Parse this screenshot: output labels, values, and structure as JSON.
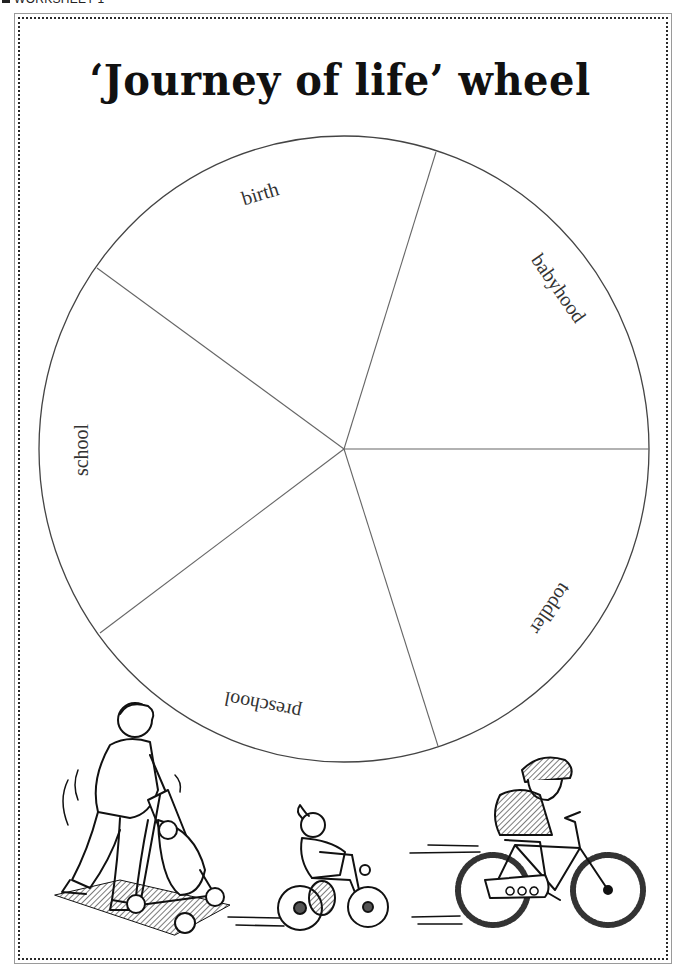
{
  "header": {
    "tag_label": "WORKSHEET 1"
  },
  "title": "‘Journey of life’ wheel",
  "wheel": {
    "center": [
      344,
      449
    ],
    "radius_x": 305,
    "radius_y": 313,
    "segments": [
      {
        "label": "birth"
      },
      {
        "label": "babyhood"
      },
      {
        "label": "toddler"
      },
      {
        "label": "preschool"
      },
      {
        "label": "school"
      }
    ]
  },
  "illustrations": [
    {
      "name": "parent-with-pram",
      "description": "Adult pushing baby in a pram"
    },
    {
      "name": "child-on-tricycle",
      "description": "Young girl riding a tricycle"
    },
    {
      "name": "child-on-bicycle",
      "description": "Child with helmet riding a bicycle"
    }
  ],
  "colors": {
    "ink": "#111111",
    "line": "#555555",
    "frame": "#9a9a9a",
    "background": "#ffffff"
  }
}
